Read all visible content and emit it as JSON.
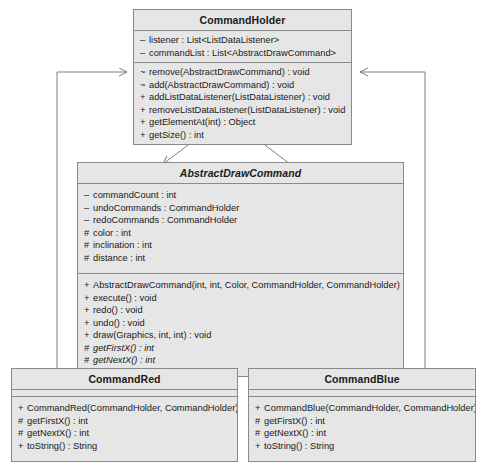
{
  "diagram": {
    "kind": "uml-class-diagram",
    "background": "#ffffff",
    "box_fill": "#e6e6e6",
    "box_stroke": "#8a8a8a",
    "text_color": "#1a1a1a"
  },
  "classes": {
    "command_holder": {
      "name": "CommandHolder",
      "abstract": false,
      "attributes": [
        {
          "vis": "–",
          "text": "listener : List<ListDataListener>"
        },
        {
          "vis": "–",
          "text": "commandList : List<AbstractDrawCommand>"
        }
      ],
      "operations": [
        {
          "vis": "~",
          "text": "remove(AbstractDrawCommand) : void"
        },
        {
          "vis": "~",
          "text": "add(AbstractDrawCommand) : void"
        },
        {
          "vis": "+",
          "text": "addListDataListener(ListDataListener) : void"
        },
        {
          "vis": "+",
          "text": "removeListDataListener(ListDataListener) : void"
        },
        {
          "vis": "+",
          "text": "getElementAt(int) : Object"
        },
        {
          "vis": "+",
          "text": "getSize() : int"
        }
      ]
    },
    "abstract_draw_command": {
      "name": "AbstractDrawCommand",
      "abstract": true,
      "attributes": [
        {
          "vis": "–",
          "text": "commandCount : int"
        },
        {
          "vis": "–",
          "text": "undoCommands : CommandHolder"
        },
        {
          "vis": "–",
          "text": "redoCommands : CommandHolder"
        },
        {
          "vis": "#",
          "text": "color : int"
        },
        {
          "vis": "#",
          "text": "inclination : int"
        },
        {
          "vis": "#",
          "text": "distance : int"
        }
      ],
      "operations": [
        {
          "vis": "+",
          "text": "AbstractDrawCommand(int, int, Color, CommandHolder, CommandHolder)",
          "italic": false
        },
        {
          "vis": "+",
          "text": "execute() : void",
          "italic": false
        },
        {
          "vis": "+",
          "text": "redo() : void",
          "italic": false
        },
        {
          "vis": "+",
          "text": "undo() : void",
          "italic": false
        },
        {
          "vis": "+",
          "text": "draw(Graphics, int, int) : void",
          "italic": false
        },
        {
          "vis": "#",
          "text": "getFirstX() : int",
          "italic": true
        },
        {
          "vis": "#",
          "text": "getNextX() : int",
          "italic": true
        }
      ]
    },
    "command_red": {
      "name": "CommandRed",
      "abstract": false,
      "attributes": [],
      "operations": [
        {
          "vis": "+",
          "text": "CommandRed(CommandHolder, CommandHolder)"
        },
        {
          "vis": "#",
          "text": "getFirstX() : int"
        },
        {
          "vis": "#",
          "text": "getNextX() : int"
        },
        {
          "vis": "+",
          "text": "toString() : String"
        }
      ]
    },
    "command_blue": {
      "name": "CommandBlue",
      "abstract": false,
      "attributes": [],
      "operations": [
        {
          "vis": "+",
          "text": "CommandBlue(CommandHolder, CommandHolder)"
        },
        {
          "vis": "#",
          "text": "getFirstX() : int"
        },
        {
          "vis": "#",
          "text": "getNextX() : int"
        },
        {
          "vis": "+",
          "text": "toString() : String"
        }
      ]
    }
  },
  "relationships": [
    {
      "id": "assoc-holder-to-abstract",
      "type": "association",
      "from": "CommandHolder",
      "to": "AbstractDrawCommand"
    },
    {
      "id": "assoc-abstract-to-holder",
      "type": "association",
      "from": "AbstractDrawCommand",
      "to": "CommandHolder"
    },
    {
      "id": "gen-red-to-abstract",
      "type": "generalization",
      "from": "CommandRed",
      "to": "AbstractDrawCommand"
    },
    {
      "id": "gen-blue-to-abstract",
      "type": "generalization",
      "from": "CommandBlue",
      "to": "AbstractDrawCommand"
    },
    {
      "id": "assoc-red-to-holder",
      "type": "association",
      "from": "CommandRed",
      "to": "CommandHolder"
    },
    {
      "id": "assoc-blue-to-holder",
      "type": "association",
      "from": "CommandBlue",
      "to": "CommandHolder"
    }
  ]
}
